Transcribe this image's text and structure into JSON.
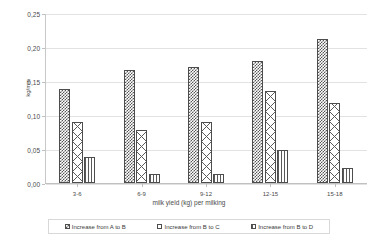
{
  "chart_data": {
    "type": "bar",
    "title": "",
    "xlabel": "milk yield (kg) per milking",
    "ylabel": "kg/min",
    "categories": [
      "3-6",
      "6-9",
      "9-12",
      "12-15",
      "15-18"
    ],
    "ylim": [
      0.0,
      0.25
    ],
    "ytick_labels": [
      "0,00",
      "0,05",
      "0,10",
      "0,15",
      "0,20",
      "0,25"
    ],
    "ytick_values": [
      0.0,
      0.05,
      0.1,
      0.15,
      0.2,
      0.25
    ],
    "grid": true,
    "legend_position": "bottom",
    "series": [
      {
        "name": "Increase from A to B",
        "pattern": "checker",
        "values": [
          0.138,
          0.166,
          0.17,
          0.18,
          0.212
        ]
      },
      {
        "name": "Increase from B to C",
        "pattern": "diamond",
        "values": [
          0.089,
          0.078,
          0.089,
          0.135,
          0.117
        ]
      },
      {
        "name": "Increase from B to D",
        "pattern": "vlines",
        "values": [
          0.038,
          0.013,
          0.013,
          0.048,
          0.022
        ]
      }
    ]
  },
  "axis": {
    "y_title": "kg/min",
    "x_title": "milk yield (kg) per milking"
  },
  "legend": {
    "items": [
      {
        "label": "Increase from A to B"
      },
      {
        "label": "Increase from B to C"
      },
      {
        "label": "Increase from B to D"
      }
    ]
  }
}
